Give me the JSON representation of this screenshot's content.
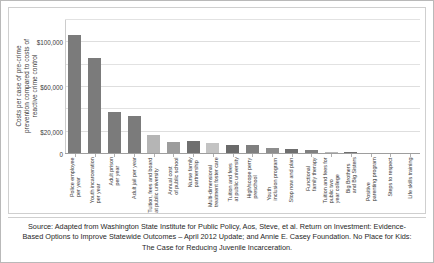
{
  "chart_data": {
    "type": "bar",
    "title": "",
    "xlabel": "",
    "ylabel": "Costs per case of pre-crime prevention compared to costs of reactive crime control",
    "ylabel_lines": [
      "Costs per case of pre-crime",
      "prevention compared to costs of",
      "reactive crime control"
    ],
    "ylim": [
      0,
      120000
    ],
    "ytick_values": [
      0,
      20000,
      40000,
      60000,
      80000,
      100000,
      120000
    ],
    "ytick_labels": [
      "0",
      "$20,000",
      "",
      "$60,000",
      "",
      "$100,000",
      ""
    ],
    "grid": true,
    "grid_axis": "y",
    "legend": "none",
    "bar_color": "#7b7b7b",
    "categories": [
      "Police employee per year",
      "Youth incarceration per year",
      "Adult prison per year",
      "Adult jail per year",
      "Tuition, fees and board at public university",
      "Annual cost of public school",
      "Nurse family partnership",
      "Multi-dimensional treatment foster care",
      "Tuition and fees at public university",
      "High/scope perry preschool",
      "Youth inclusion program",
      "Stop now and plan",
      "Functional family therapy",
      "Tuition and fees for public two year college",
      "Big Brothers and Big Sisters",
      "Positive parenting program",
      "Steps to respect",
      "Life skills training"
    ],
    "category_lines": [
      [
        "Police employee",
        "per year"
      ],
      [
        "Youth incarceration",
        "per year"
      ],
      [
        "Adult prison",
        "per year"
      ],
      [
        "Adult jail per year"
      ],
      [
        "Tuition, fees and board",
        "at public university"
      ],
      [
        "Annual cost",
        "of public school"
      ],
      [
        "Nurse family",
        "partnership"
      ],
      [
        "Multi-dimensional",
        "treatment foster care"
      ],
      [
        "Tuition and fees",
        "at public university"
      ],
      [
        "High/scope perry",
        "preschool"
      ],
      [
        "Youth",
        "inclusion program"
      ],
      [
        "Stop now and plan"
      ],
      [
        "Functional",
        "family therapy"
      ],
      [
        "Tuition and fees for",
        "public two",
        "year college"
      ],
      [
        "Big Brothers",
        "and Big Sisters"
      ],
      [
        "Positive",
        "parenting program"
      ],
      [
        "Steps to respect"
      ],
      [
        "Life skills training"
      ]
    ],
    "values": [
      107000,
      86000,
      38000,
      34000,
      17000,
      10500,
      11500,
      10000,
      8500,
      8000,
      5000,
      4500,
      3200,
      2200,
      1500,
      900,
      600,
      400
    ],
    "bar_colors": [
      "#7b7b7b",
      "#7b7b7b",
      "#7b7b7b",
      "#7b7b7b",
      "#b5b5b5",
      "#9c9c9c",
      "#6f6f6f",
      "#c3c3c3",
      "#6a6a6a",
      "#7f7f7f",
      "#8d8d8d",
      "#6e6e6e",
      "#808080",
      "#b9b9b9",
      "#707070",
      "#8a8a8a",
      "#7a7a7a",
      "#888888"
    ]
  },
  "caption": {
    "text": "Source: Adapted from Washington State Institute for Public Policy, Aos, Steve, et al. Return on Investment: Evidence-Based Options to Improve Statewide Outcomes – April 2012 Update; and Annie E. Casey Foundation. No Place for Kids: The Case for Reducing Juvenile Incarceration."
  }
}
